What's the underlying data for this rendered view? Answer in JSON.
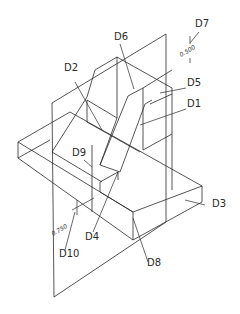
{
  "drawing": {
    "type": "isometric wireframe with section planes",
    "stroke_color": "#2a2a2a",
    "background": "#ffffff"
  },
  "labels": [
    {
      "id": "D1",
      "text": "D1",
      "x": 187,
      "y": 107
    },
    {
      "id": "D2",
      "text": "D2",
      "x": 64,
      "y": 71
    },
    {
      "id": "D3",
      "text": "D3",
      "x": 212,
      "y": 207
    },
    {
      "id": "D4",
      "text": "D4",
      "x": 85,
      "y": 240
    },
    {
      "id": "D5",
      "text": "D5",
      "x": 187,
      "y": 86
    },
    {
      "id": "D6",
      "text": "D6",
      "x": 114,
      "y": 40
    },
    {
      "id": "D7",
      "text": "D7",
      "x": 195,
      "y": 27
    },
    {
      "id": "D8",
      "text": "D8",
      "x": 147,
      "y": 266
    },
    {
      "id": "D9",
      "text": "D9",
      "x": 72,
      "y": 156
    },
    {
      "id": "D10",
      "text": "D10",
      "x": 59,
      "y": 257
    }
  ],
  "dimensions": [
    {
      "id": "dim-0500",
      "text": "0.500",
      "x": 183,
      "y": 57,
      "rotate": -30
    },
    {
      "id": "dim-0750",
      "text": "0.750",
      "x": 55,
      "y": 236,
      "rotate": -30
    }
  ]
}
